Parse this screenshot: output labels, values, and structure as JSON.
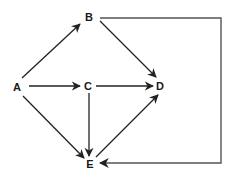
{
  "diagram": {
    "type": "directed-graph",
    "nodes": [
      {
        "id": "A",
        "label": "A",
        "x": 17,
        "y": 87
      },
      {
        "id": "B",
        "label": "B",
        "x": 89,
        "y": 17
      },
      {
        "id": "C",
        "label": "C",
        "x": 88,
        "y": 86
      },
      {
        "id": "D",
        "label": "D",
        "x": 160,
        "y": 86
      },
      {
        "id": "E",
        "label": "E",
        "x": 90,
        "y": 164
      }
    ],
    "edges": [
      {
        "from": "A",
        "to": "B"
      },
      {
        "from": "A",
        "to": "C"
      },
      {
        "from": "A",
        "to": "E"
      },
      {
        "from": "B",
        "to": "D"
      },
      {
        "from": "B",
        "to": "E",
        "routing": "orthogonal-right"
      },
      {
        "from": "C",
        "to": "D"
      },
      {
        "from": "C",
        "to": "E"
      },
      {
        "from": "E",
        "to": "D"
      }
    ],
    "colors": {
      "edge": "#222222",
      "loop_edge": "#555555",
      "label": "#1a1a1a",
      "background": "#ffffff"
    }
  }
}
